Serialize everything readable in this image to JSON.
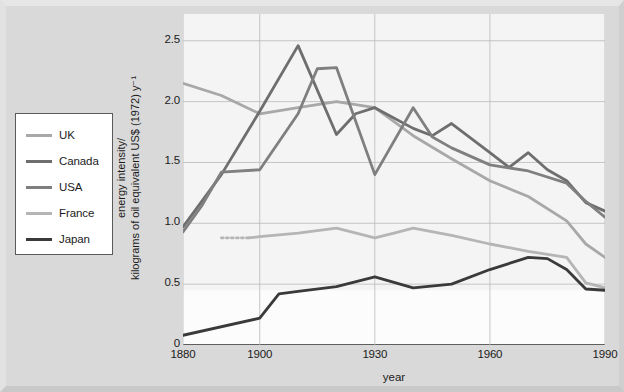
{
  "chart_data": {
    "type": "line",
    "title": "",
    "xlabel": "year",
    "ylabel": "energy intensity/ kilograms of oil equivalent US$ (1972) y⁻¹",
    "ylabel_line1": "energy intensity/",
    "ylabel_line2": "kilograms of oil equivalent US$ (1972) y⁻¹",
    "xlim": [
      1880,
      1990
    ],
    "ylim": [
      0,
      2.72
    ],
    "grid": true,
    "legend_position": "left-outside",
    "xticks": [
      1880,
      1900,
      1930,
      1960,
      1990
    ],
    "xtick_labels": [
      "1880",
      "1900",
      "1930",
      "1960",
      "1990"
    ],
    "yticks": [
      0,
      0.5,
      1.0,
      1.5,
      2.0,
      2.5
    ],
    "ytick_labels": [
      "0",
      "0.5",
      "1.0",
      "1.5",
      "2.0",
      "2.5"
    ],
    "series": [
      {
        "name": "UK",
        "color": "#a8a8a8",
        "x": [
          1880,
          1890,
          1900,
          1910,
          1920,
          1930,
          1940,
          1950,
          1960,
          1970,
          1980,
          1985,
          1990
        ],
        "y": [
          2.15,
          2.05,
          1.9,
          1.95,
          2.0,
          1.95,
          1.72,
          1.53,
          1.35,
          1.22,
          1.02,
          0.83,
          0.72
        ]
      },
      {
        "name": "Canada",
        "color": "#6e6e6e",
        "x": [
          1880,
          1890,
          1900,
          1910,
          1920,
          1925,
          1930,
          1940,
          1945,
          1950,
          1960,
          1965,
          1970,
          1975,
          1980,
          1985,
          1990
        ],
        "y": [
          0.97,
          1.4,
          1.92,
          2.46,
          1.73,
          1.9,
          1.95,
          1.78,
          1.72,
          1.82,
          1.58,
          1.46,
          1.58,
          1.44,
          1.35,
          1.17,
          1.1
        ]
      },
      {
        "name": "USA",
        "color": "#7f7f7f",
        "x": [
          1880,
          1885,
          1890,
          1900,
          1910,
          1915,
          1920,
          1930,
          1940,
          1945,
          1950,
          1960,
          1970,
          1980,
          1985,
          1990
        ],
        "y": [
          0.93,
          1.15,
          1.42,
          1.44,
          1.9,
          2.27,
          2.28,
          1.4,
          1.95,
          1.71,
          1.62,
          1.48,
          1.43,
          1.33,
          1.18,
          1.05
        ]
      },
      {
        "name": "France",
        "color": "#b5b5b5",
        "x": [
          1897,
          1900,
          1910,
          1920,
          1930,
          1935,
          1940,
          1950,
          1960,
          1970,
          1980,
          1985,
          1990
        ],
        "y": [
          0.88,
          0.89,
          0.92,
          0.96,
          0.88,
          0.92,
          0.96,
          0.9,
          0.83,
          0.77,
          0.72,
          0.51,
          0.47
        ]
      },
      {
        "name": "France-dotted",
        "color": "#b5b5b5",
        "dashed": true,
        "x": [
          1890,
          1897
        ],
        "y": [
          0.88,
          0.88
        ]
      },
      {
        "name": "Japan",
        "color": "#3a3a3a",
        "x": [
          1880,
          1900,
          1905,
          1910,
          1920,
          1930,
          1940,
          1950,
          1960,
          1970,
          1975,
          1980,
          1985,
          1990
        ],
        "y": [
          0.08,
          0.22,
          0.42,
          0.44,
          0.48,
          0.56,
          0.47,
          0.5,
          0.62,
          0.72,
          0.71,
          0.62,
          0.46,
          0.45
        ]
      }
    ],
    "legend_entries": [
      {
        "label": "UK",
        "color": "#a8a8a8"
      },
      {
        "label": "Canada",
        "color": "#6e6e6e"
      },
      {
        "label": "USA",
        "color": "#7f7f7f"
      },
      {
        "label": "France",
        "color": "#b5b5b5"
      },
      {
        "label": "Japan",
        "color": "#3a3a3a"
      }
    ]
  }
}
